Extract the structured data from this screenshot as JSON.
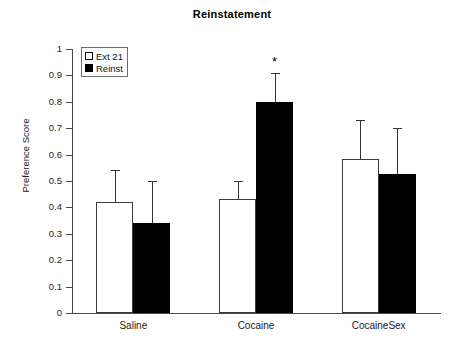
{
  "chart_data": {
    "type": "bar",
    "title": "Reinstatement",
    "xlabel": "",
    "ylabel": "Preference Score",
    "ylim": [
      0,
      1
    ],
    "ytick_labels": [
      "0",
      "0.1",
      "0.2",
      "0.3",
      "0.4",
      "0.5",
      "0.6",
      "0.7",
      "0.8",
      "0.9",
      "1"
    ],
    "ytick_values": [
      0,
      0.1,
      0.2,
      0.3,
      0.4,
      0.5,
      0.6,
      0.7,
      0.8,
      0.9,
      1
    ],
    "grid": false,
    "legend_position": "upper left",
    "categories": [
      "Saline",
      "Cocaine",
      "CocaineSex"
    ],
    "series": [
      {
        "name": "Ext 21",
        "fill": "white",
        "values": [
          0.42,
          0.43,
          0.585
        ],
        "errors_upper": [
          0.54,
          0.5,
          0.73
        ]
      },
      {
        "name": "Reinst",
        "fill": "black",
        "values": [
          0.34,
          0.8,
          0.525
        ],
        "errors_upper": [
          0.5,
          0.91,
          0.7
        ]
      }
    ],
    "annotations": [
      {
        "text": "*",
        "category": "Cocaine",
        "series": "Reinst",
        "meaning": "significance-marker"
      }
    ]
  },
  "legend": {
    "items": [
      {
        "label": "Ext 21",
        "swatch": "open-square"
      },
      {
        "label": "Reinst",
        "swatch": "filled-square"
      }
    ]
  },
  "colors": {
    "open_bar_fill": "#ffffff",
    "filled_bar_fill": "#000000",
    "bar_edge": "#3a3a3a",
    "axis": "#4a4a4a",
    "error_bar": "#333333",
    "text": "#000000",
    "background": "#ffffff"
  }
}
